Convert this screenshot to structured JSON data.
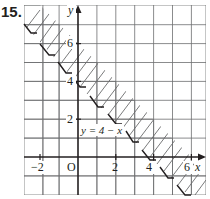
{
  "problem_number": "15.",
  "graph": {
    "x_axis_label": "x",
    "y_axis_label": "y",
    "origin_label": "O",
    "x_ticks": [
      {
        "value": -2,
        "label": "−2"
      },
      {
        "value": 2,
        "label": "2"
      },
      {
        "value": 4,
        "label": "4"
      },
      {
        "value": 6,
        "label": "6"
      }
    ],
    "y_ticks": [
      {
        "value": 2,
        "label": "2"
      },
      {
        "value": 4,
        "label": "4"
      },
      {
        "value": 6,
        "label": "6"
      }
    ],
    "boundary_equation": "y = 4 − x",
    "boundary_style": "dashed",
    "shaded_side": "above-right of boundary (hatched band)",
    "x_range": [
      -3,
      7
    ],
    "y_range": [
      -2,
      8
    ],
    "colors": {
      "grid": "#6d6e70",
      "axis": "#231f20",
      "hatch": "#58595b",
      "background": "#ffffff"
    }
  }
}
